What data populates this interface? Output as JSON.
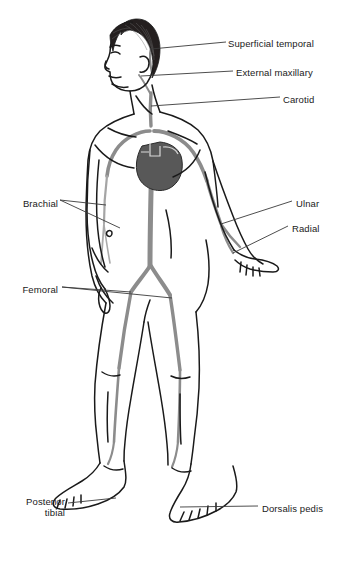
{
  "diagram": {
    "colors": {
      "artery": "#8c8c8c",
      "artery_light": "#9e9e9e",
      "heart": "#585858",
      "outline": "#1a1a1a",
      "hair": "#241f1f",
      "leader": "#3a3a3a",
      "background": "#ffffff"
    },
    "labels_right": [
      {
        "id": "superficial-temporal",
        "text": "Superficial temporal",
        "x": 228,
        "y": 38
      },
      {
        "id": "external-maxillary",
        "text": "External maxillary",
        "x": 236,
        "y": 67
      },
      {
        "id": "carotid",
        "text": "Carotid",
        "x": 283,
        "y": 94
      },
      {
        "id": "ulnar",
        "text": "Ulnar",
        "x": 296,
        "y": 198
      },
      {
        "id": "radial",
        "text": "Radial",
        "x": 292,
        "y": 223
      },
      {
        "id": "dorsalis-pedis",
        "text": "Dorsalis pedis",
        "x": 262,
        "y": 503
      }
    ],
    "labels_left": [
      {
        "id": "brachial",
        "text": "Brachial",
        "x": 18,
        "y": 198
      },
      {
        "id": "femoral",
        "text": "Femoral",
        "x": 18,
        "y": 284
      },
      {
        "id": "posterior-tibial",
        "text": "Posterior\ntibial",
        "x": 18,
        "y": 496
      }
    ],
    "arteries": [
      "aorta",
      "aortic arch",
      "carotid",
      "subclavian",
      "brachial",
      "radial",
      "ulnar",
      "iliac",
      "femoral",
      "popliteal",
      "posterior tibial",
      "dorsalis pedis",
      "superficial temporal",
      "external maxillary"
    ]
  }
}
